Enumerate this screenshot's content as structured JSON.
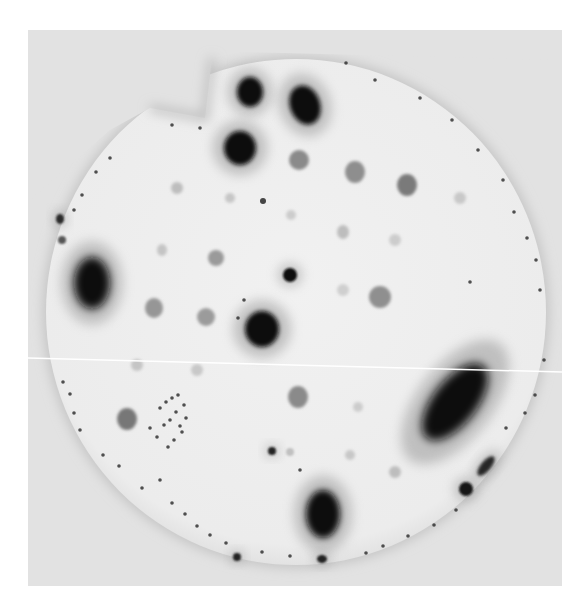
{
  "image": {
    "description": "Grayscale autoradiograph of a circular membrane with dark and grey spots",
    "frame": {
      "x": 28,
      "y": 30,
      "width": 534,
      "height": 556,
      "color": "#e4e4e4"
    },
    "membrane": {
      "cx": 296,
      "cy": 312,
      "rx": 250,
      "ry": 253,
      "color": "#efefef",
      "edge_color": "#c4c4c4"
    },
    "scan_line": {
      "x1": 28,
      "y1": 358,
      "x2": 562,
      "y2": 372,
      "color": "#ffffff"
    },
    "notch": {
      "points": "210,55 150,115 120,112 205,118 230,55"
    },
    "spots": [
      {
        "id": "top-dark-1",
        "cx": 250,
        "cy": 92,
        "rx": 13,
        "ry": 15,
        "tone": "#111111",
        "blur": 2
      },
      {
        "id": "top-dark-teardrop",
        "cx": 305,
        "cy": 105,
        "rx": 15,
        "ry": 20,
        "tone": "#0d0d0d",
        "blur": 2,
        "rotate": -20
      },
      {
        "id": "top-dark-2",
        "cx": 240,
        "cy": 148,
        "rx": 16,
        "ry": 17,
        "tone": "#0b0b0b",
        "blur": 2
      },
      {
        "id": "grey-1",
        "cx": 299,
        "cy": 160,
        "rx": 10,
        "ry": 10,
        "tone": "#8a8a8a",
        "blur": 1.5
      },
      {
        "id": "grey-2",
        "cx": 355,
        "cy": 172,
        "rx": 10,
        "ry": 11,
        "tone": "#8e8e8e",
        "blur": 1.5
      },
      {
        "id": "grey-3",
        "cx": 407,
        "cy": 185,
        "rx": 10,
        "ry": 11,
        "tone": "#7a7a7a",
        "blur": 1.5
      },
      {
        "id": "faint-1",
        "cx": 177,
        "cy": 188,
        "rx": 6,
        "ry": 6,
        "tone": "#bdbdbd",
        "blur": 1.5
      },
      {
        "id": "faint-2",
        "cx": 230,
        "cy": 198,
        "rx": 5,
        "ry": 5,
        "tone": "#c6c6c6",
        "blur": 1.5
      },
      {
        "id": "dot-1",
        "cx": 263,
        "cy": 201,
        "rx": 3,
        "ry": 3,
        "tone": "#444444",
        "blur": 0.6
      },
      {
        "id": "faint-3",
        "cx": 291,
        "cy": 215,
        "rx": 5,
        "ry": 5,
        "tone": "#cccccc",
        "blur": 1.5
      },
      {
        "id": "faint-4",
        "cx": 343,
        "cy": 232,
        "rx": 6,
        "ry": 7,
        "tone": "#bdbdbd",
        "blur": 1.5
      },
      {
        "id": "faint-5",
        "cx": 460,
        "cy": 198,
        "rx": 6,
        "ry": 6,
        "tone": "#c8c8c8",
        "blur": 1.5
      },
      {
        "id": "faint-6",
        "cx": 395,
        "cy": 240,
        "rx": 6,
        "ry": 6,
        "tone": "#cccccc",
        "blur": 1.5
      },
      {
        "id": "grey-4",
        "cx": 216,
        "cy": 258,
        "rx": 8,
        "ry": 8,
        "tone": "#9a9a9a",
        "blur": 1.5
      },
      {
        "id": "faint-7",
        "cx": 162,
        "cy": 250,
        "rx": 5,
        "ry": 6,
        "tone": "#c4c4c4",
        "blur": 1.5
      },
      {
        "id": "dark-small-center",
        "cx": 290,
        "cy": 275,
        "rx": 7,
        "ry": 7,
        "tone": "#111111",
        "blur": 1
      },
      {
        "id": "faint-8",
        "cx": 343,
        "cy": 290,
        "rx": 6,
        "ry": 6,
        "tone": "#cfcfcf",
        "blur": 1.5
      },
      {
        "id": "grey-5",
        "cx": 380,
        "cy": 297,
        "rx": 11,
        "ry": 11,
        "tone": "#8f8f8f",
        "blur": 1.5
      },
      {
        "id": "grey-6",
        "cx": 154,
        "cy": 308,
        "rx": 9,
        "ry": 10,
        "tone": "#969696",
        "blur": 1.5
      },
      {
        "id": "grey-7",
        "cx": 206,
        "cy": 317,
        "rx": 9,
        "ry": 9,
        "tone": "#9b9b9b",
        "blur": 1.5
      },
      {
        "id": "center-dark",
        "cx": 262,
        "cy": 329,
        "rx": 17,
        "ry": 18,
        "tone": "#0a0a0a",
        "blur": 2
      },
      {
        "id": "left-dark-blob",
        "cx": 92,
        "cy": 283,
        "rx": 18,
        "ry": 26,
        "tone": "#0c0c0c",
        "blur": 4
      },
      {
        "id": "left-edge-dot-1",
        "cx": 60,
        "cy": 219,
        "rx": 4,
        "ry": 5,
        "tone": "#2a2a2a",
        "blur": 1
      },
      {
        "id": "left-edge-dot-2",
        "cx": 62,
        "cy": 240,
        "rx": 4,
        "ry": 4,
        "tone": "#555555",
        "blur": 1
      },
      {
        "id": "faint-9",
        "cx": 137,
        "cy": 365,
        "rx": 6,
        "ry": 6,
        "tone": "#c5c5c5",
        "blur": 1.5
      },
      {
        "id": "faint-10",
        "cx": 197,
        "cy": 370,
        "rx": 6,
        "ry": 6,
        "tone": "#c8c8c8",
        "blur": 1.5
      },
      {
        "id": "grey-8",
        "cx": 298,
        "cy": 397,
        "rx": 10,
        "ry": 11,
        "tone": "#8a8a8a",
        "blur": 1.5
      },
      {
        "id": "grey-9",
        "cx": 127,
        "cy": 419,
        "rx": 10,
        "ry": 11,
        "tone": "#777777",
        "blur": 1.5
      },
      {
        "id": "faint-11",
        "cx": 358,
        "cy": 407,
        "rx": 5,
        "ry": 5,
        "tone": "#cccccc",
        "blur": 1.5
      },
      {
        "id": "right-dark-smear",
        "cx": 455,
        "cy": 402,
        "rx": 22,
        "ry": 46,
        "tone": "#0d0d0d",
        "blur": 5,
        "rotate": 38
      },
      {
        "id": "dot-2",
        "cx": 272,
        "cy": 451,
        "rx": 4,
        "ry": 4,
        "tone": "#222222",
        "blur": 0.8
      },
      {
        "id": "faint-12",
        "cx": 290,
        "cy": 452,
        "rx": 4,
        "ry": 4,
        "tone": "#c0c0c0",
        "blur": 1
      },
      {
        "id": "faint-13",
        "cx": 395,
        "cy": 472,
        "rx": 6,
        "ry": 6,
        "tone": "#bdbdbd",
        "blur": 1.5
      },
      {
        "id": "right-edge-dash",
        "cx": 486,
        "cy": 466,
        "rx": 5,
        "ry": 12,
        "tone": "#252525",
        "blur": 1.5,
        "rotate": 40
      },
      {
        "id": "right-edge-dot",
        "cx": 466,
        "cy": 489,
        "rx": 7,
        "ry": 7,
        "tone": "#151515",
        "blur": 1
      },
      {
        "id": "bottom-dark-teardrop",
        "cx": 323,
        "cy": 514,
        "rx": 17,
        "ry": 24,
        "tone": "#0b0b0b",
        "blur": 3
      },
      {
        "id": "bottom-dot-1",
        "cx": 237,
        "cy": 557,
        "rx": 4,
        "ry": 4,
        "tone": "#222222",
        "blur": 0.8
      },
      {
        "id": "bottom-dot-2",
        "cx": 322,
        "cy": 559,
        "rx": 5,
        "ry": 4,
        "tone": "#222222",
        "blur": 0.8
      },
      {
        "id": "faint-14",
        "cx": 350,
        "cy": 455,
        "rx": 5,
        "ry": 5,
        "tone": "#c7c7c7",
        "blur": 1.5
      }
    ],
    "speckles": [
      [
        160,
        408
      ],
      [
        166,
        402
      ],
      [
        172,
        398
      ],
      [
        178,
        395
      ],
      [
        184,
        405
      ],
      [
        176,
        412
      ],
      [
        170,
        420
      ],
      [
        164,
        425
      ],
      [
        180,
        426
      ],
      [
        186,
        418
      ],
      [
        157,
        437
      ],
      [
        174,
        440
      ],
      [
        168,
        447
      ],
      [
        182,
        432
      ],
      [
        150,
        428
      ],
      [
        63,
        382
      ],
      [
        70,
        394
      ],
      [
        74,
        413
      ],
      [
        80,
        430
      ],
      [
        103,
        455
      ],
      [
        119,
        466
      ],
      [
        142,
        488
      ],
      [
        172,
        503
      ],
      [
        185,
        514
      ],
      [
        197,
        526
      ],
      [
        210,
        535
      ],
      [
        226,
        543
      ],
      [
        262,
        552
      ],
      [
        290,
        556
      ],
      [
        366,
        553
      ],
      [
        383,
        546
      ],
      [
        408,
        536
      ],
      [
        434,
        525
      ],
      [
        456,
        510
      ],
      [
        506,
        428
      ],
      [
        525,
        413
      ],
      [
        535,
        395
      ],
      [
        544,
        360
      ],
      [
        540,
        290
      ],
      [
        536,
        260
      ],
      [
        527,
        238
      ],
      [
        514,
        212
      ],
      [
        503,
        180
      ],
      [
        478,
        150
      ],
      [
        452,
        120
      ],
      [
        420,
        98
      ],
      [
        375,
        80
      ],
      [
        346,
        63
      ],
      [
        110,
        158
      ],
      [
        96,
        172
      ],
      [
        82,
        195
      ],
      [
        74,
        210
      ],
      [
        200,
        128
      ],
      [
        172,
        125
      ],
      [
        238,
        318
      ],
      [
        244,
        300
      ],
      [
        160,
        480
      ],
      [
        300,
        470
      ],
      [
        470,
        282
      ]
    ]
  }
}
